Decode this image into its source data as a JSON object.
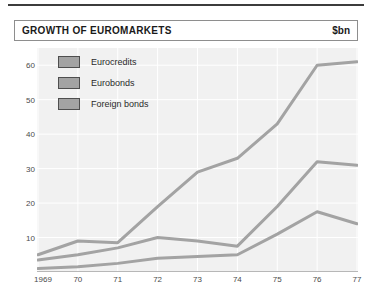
{
  "header": {
    "title": "GROWTH OF EUROMARKETS",
    "unit": "$bn"
  },
  "chart_data": {
    "type": "line",
    "title": "GROWTH OF EUROMARKETS",
    "xlabel": "",
    "ylabel": "$bn",
    "ylim": [
      0,
      65
    ],
    "yticks": [
      10,
      20,
      30,
      40,
      50,
      60
    ],
    "grid": true,
    "legend_position": "top-left",
    "categories": [
      "1969",
      "70",
      "71",
      "72",
      "73",
      "74",
      "75",
      "76",
      "77"
    ],
    "x": [
      1969,
      1970,
      1971,
      1972,
      1973,
      1974,
      1975,
      1976,
      1977
    ],
    "series": [
      {
        "name": "Eurocredits",
        "color": "#a3a3a3",
        "values": [
          5,
          9,
          8.5,
          19,
          29,
          33,
          43,
          60,
          61
        ]
      },
      {
        "name": "Eurobonds",
        "color": "#a3a3a3",
        "values": [
          3.5,
          5,
          7,
          10,
          9,
          7.5,
          19,
          32,
          31
        ]
      },
      {
        "name": "Foreign bonds",
        "color": "#a3a3a3",
        "values": [
          1,
          1.5,
          2.5,
          4,
          4.5,
          5,
          11,
          17.5,
          14
        ]
      }
    ]
  },
  "legend": {
    "items": [
      {
        "label": "Eurocredits",
        "color": "#a3a3a3"
      },
      {
        "label": "Eurobonds",
        "color": "#a3a3a3"
      },
      {
        "label": "Foreign bonds",
        "color": "#a3a3a3"
      }
    ]
  },
  "axes": {
    "y_ticks": [
      "60",
      "50",
      "40",
      "30",
      "20",
      "10"
    ],
    "x_ticks": [
      "1969",
      "70",
      "71",
      "72",
      "73",
      "74",
      "75",
      "76",
      "77"
    ]
  }
}
